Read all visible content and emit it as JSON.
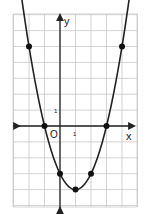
{
  "chart_data": {
    "type": "line",
    "title": "",
    "function": "y = x^2 - 2x - 3",
    "xlabel": "x",
    "ylabel": "y",
    "origin_label": "O",
    "tick_labels": {
      "x": "1",
      "y": "1"
    },
    "xlim": [
      -3,
      5
    ],
    "ylim": [
      -5,
      7
    ],
    "grid": true,
    "legend": null,
    "points": [
      {
        "x": -2,
        "y": 5
      },
      {
        "x": -1,
        "y": 0
      },
      {
        "x": 0,
        "y": -3
      },
      {
        "x": 1,
        "y": -4
      },
      {
        "x": 2,
        "y": -3
      },
      {
        "x": 3,
        "y": 0
      },
      {
        "x": 4,
        "y": 5
      }
    ],
    "curve_extends_with_arrows": true
  },
  "colors": {
    "grid": "#c8c8c8",
    "axis": "#222222",
    "curve": "#222222",
    "point": "#111111"
  }
}
